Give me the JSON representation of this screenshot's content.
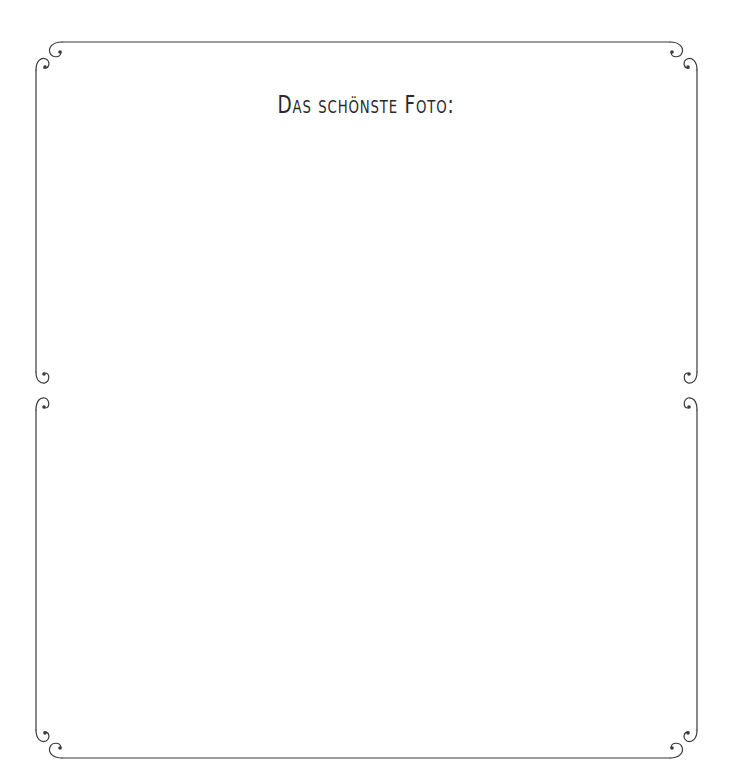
{
  "page": {
    "title": "Das schönste Foto:",
    "sections": [
      {
        "name": "top-photo-frame",
        "content": ""
      },
      {
        "name": "bottom-photo-frame",
        "content": ""
      }
    ]
  },
  "colors": {
    "line": "#3a3a3a",
    "text": "#2a2a2a",
    "background": "#ffffff"
  }
}
